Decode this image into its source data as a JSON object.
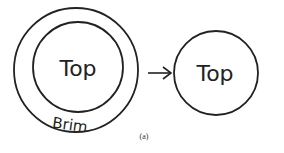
{
  "diagram": {
    "left": {
      "inner_label": "Top",
      "ring_label": "Brim"
    },
    "arrow": "right-arrow",
    "right": {
      "label": "Top"
    },
    "caption": "(a)",
    "colors": {
      "stroke": "#222222",
      "background": "#ffffff"
    }
  }
}
